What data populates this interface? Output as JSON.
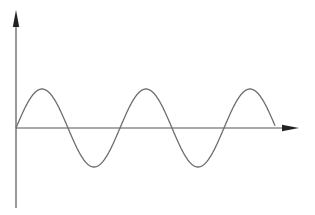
{
  "diagram": {
    "type": "sine-wave-on-axes",
    "width": 315,
    "height": 215,
    "colors": {
      "background": "#ffffff",
      "axis": "#555555",
      "arrowhead": "#222222",
      "curve": "#6e6e6e"
    },
    "y_axis": {
      "x": 16,
      "top": 10,
      "bottom": 208,
      "arrow_at": "top"
    },
    "x_axis": {
      "y": 128,
      "left": 16,
      "right": 299,
      "arrow_at": "right"
    },
    "wave": {
      "origin_x": 16,
      "baseline_y": 128,
      "amplitude_px": 39,
      "period_px": 104,
      "end_x": 275,
      "peaks": [
        {
          "x": 43,
          "y": 89
        },
        {
          "x": 147,
          "y": 89
        },
        {
          "x": 250,
          "y": 90
        }
      ],
      "troughs": [
        {
          "x": 94,
          "y": 168
        },
        {
          "x": 197,
          "y": 168
        }
      ],
      "zero_crossings": [
        16,
        68,
        121,
        172,
        224,
        275
      ]
    }
  }
}
